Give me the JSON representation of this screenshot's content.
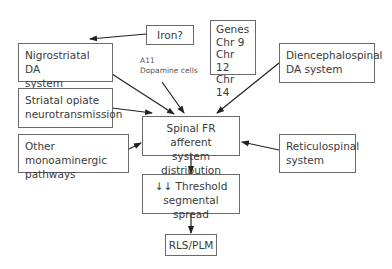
{
  "nodes": {
    "iron": "Iron?",
    "nigrostriatal": [
      "Nigrostriatal DA",
      "system"
    ],
    "genes": [
      "Genes",
      "Chr 9",
      "Chr 12",
      "Chr 14"
    ],
    "diencephalospinal": [
      "Diencephalospinal",
      "DA system"
    ],
    "striatal": [
      "Striatal opiate",
      "neurotransmission"
    ],
    "other": [
      "Other monoaminergic",
      "pathways"
    ],
    "spinal": [
      "Spinal FR afferent",
      "system distribution"
    ],
    "reticulospinal": [
      "Reticulospinal",
      "system"
    ],
    "threshold": [
      "↓↓ Threshold",
      "segmental spread"
    ],
    "rls": "RLS/PLM"
  },
  "labels": {
    "a11": [
      "A11",
      "Dopamine cells"
    ]
  },
  "colors": {
    "border": "#6a6a6a",
    "arrow": "#222222",
    "text": "#3a3a3a"
  }
}
